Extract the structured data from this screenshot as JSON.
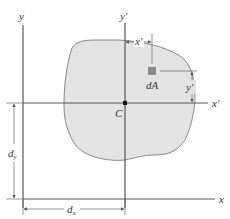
{
  "diagram": {
    "type": "parallel-axis-theorem",
    "colors": {
      "background": "#ffffff",
      "area_fill": "#e3e3e3",
      "area_stroke": "#6e6e6e",
      "axis": "#555555",
      "element": "#8a8a8a",
      "centroid": "#111111"
    },
    "labels": {
      "y_axis": "y",
      "x_axis": "x",
      "y_prime_axis": "y′",
      "x_prime_axis": "x′",
      "x_prime_dim": "x′",
      "y_prime_dim": "y′",
      "element": "dA",
      "centroid": "C",
      "dy": "d",
      "dy_sub": "y",
      "dx": "d",
      "dx_sub": "x"
    }
  }
}
